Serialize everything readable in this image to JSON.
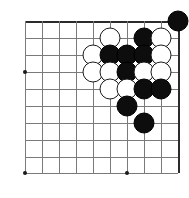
{
  "figure": {
    "kind": "go-board-diagram",
    "board_size_shown": {
      "columns": 10,
      "rows": 10
    },
    "colors": {
      "grid": "#7a7a7a",
      "border": "#2b2b2b",
      "black_stone": "#0d0d0d",
      "white_stone": "#ffffff",
      "white_stone_outline": "#1a1a1a",
      "background": "#ffffff"
    }
  },
  "grid": {
    "vertical_x": [
      25,
      42,
      59,
      76,
      93,
      110,
      127,
      144,
      161,
      178
    ],
    "horizontal_y": [
      21,
      38,
      55,
      72,
      89,
      106,
      123,
      140,
      157,
      173
    ],
    "top_edge_y": 21,
    "right_edge_x": 178,
    "left_open_x": 25,
    "bottom_open_y": 173
  },
  "star_points": [
    {
      "name": "star-left",
      "x": 25,
      "y": 72
    },
    {
      "name": "star-bottom-left",
      "x": 25,
      "y": 173
    },
    {
      "name": "star-bottom-center",
      "x": 127,
      "y": 173
    }
  ],
  "stones": [
    {
      "color": "black",
      "x": 178,
      "y": 21,
      "label": "black-stone-corner"
    },
    {
      "color": "white",
      "x": 110,
      "y": 38,
      "label": "white-stone"
    },
    {
      "color": "black",
      "x": 144,
      "y": 38,
      "label": "black-stone"
    },
    {
      "color": "white",
      "x": 161,
      "y": 38,
      "label": "white-stone"
    },
    {
      "color": "white",
      "x": 93,
      "y": 55,
      "label": "white-stone"
    },
    {
      "color": "black",
      "x": 110,
      "y": 55,
      "label": "black-stone"
    },
    {
      "color": "black",
      "x": 127,
      "y": 55,
      "label": "black-stone"
    },
    {
      "color": "black",
      "x": 144,
      "y": 55,
      "label": "black-stone"
    },
    {
      "color": "white",
      "x": 161,
      "y": 55,
      "label": "white-stone"
    },
    {
      "color": "white",
      "x": 93,
      "y": 72,
      "label": "white-stone"
    },
    {
      "color": "white",
      "x": 110,
      "y": 72,
      "label": "white-stone"
    },
    {
      "color": "black",
      "x": 127,
      "y": 72,
      "label": "black-stone"
    },
    {
      "color": "white",
      "x": 144,
      "y": 72,
      "label": "white-stone"
    },
    {
      "color": "white",
      "x": 161,
      "y": 72,
      "label": "white-stone"
    },
    {
      "color": "white",
      "x": 110,
      "y": 89,
      "label": "white-stone"
    },
    {
      "color": "white",
      "x": 127,
      "y": 89,
      "label": "white-stone"
    },
    {
      "color": "black",
      "x": 144,
      "y": 89,
      "label": "black-stone"
    },
    {
      "color": "black",
      "x": 161,
      "y": 89,
      "label": "black-stone"
    },
    {
      "color": "black",
      "x": 127,
      "y": 106,
      "label": "black-stone"
    },
    {
      "color": "black",
      "x": 144,
      "y": 123,
      "label": "black-stone"
    }
  ],
  "counts": {
    "black_stones": 9,
    "white_stones": 11,
    "total_stones": 20
  }
}
